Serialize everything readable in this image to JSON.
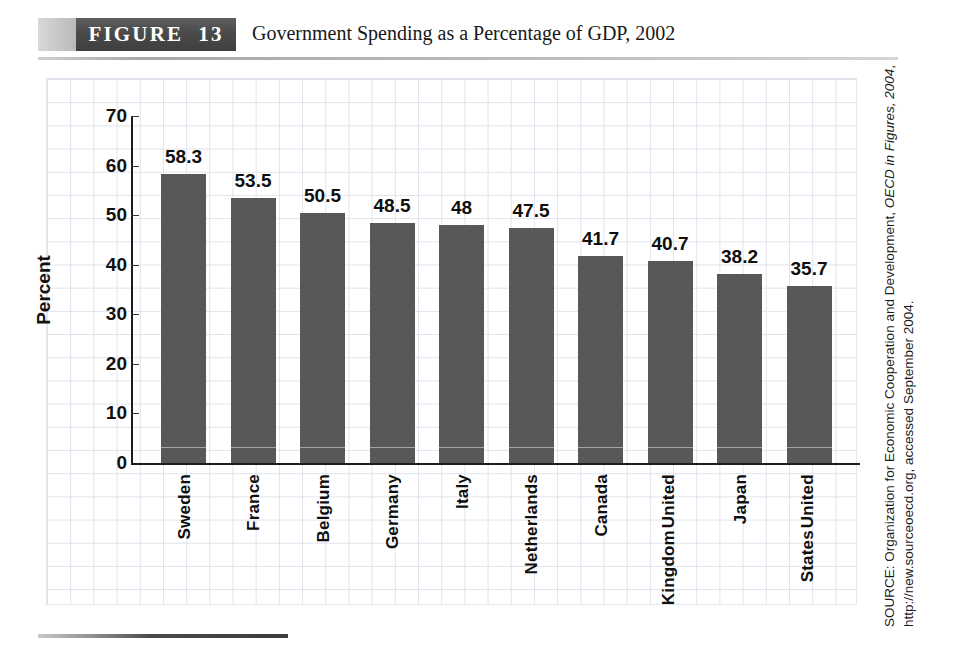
{
  "header": {
    "banner_label": "FIGURE  13",
    "title": "Government Spending as a Percentage of GDP, 2002",
    "banner_dark_color": "#474747",
    "banner_light_color": "#c9c9c9"
  },
  "source": {
    "prefix": "SOURCE: Organization for Economic Cooperation and Development, ",
    "italic": "OECD in Figures, 2004",
    "suffix": ", http://new.sourceoecd.org, accessed September 2004."
  },
  "chart_data": {
    "type": "bar",
    "title": "Government Spending as a Percentage of GDP, 2002",
    "xlabel": "",
    "ylabel": "Percent",
    "ylim": [
      0,
      70
    ],
    "yticks": [
      70,
      60,
      50,
      40,
      30,
      20,
      10,
      0
    ],
    "grid": true,
    "legend": "none",
    "bar_color": "#585858",
    "categories": [
      "Sweden",
      "France",
      "Belgium",
      "Germany",
      "Italy",
      "Netherlands",
      "Canada",
      "United Kingdom",
      "Japan",
      "United States"
    ],
    "category_lines": [
      [
        "Sweden"
      ],
      [
        "France"
      ],
      [
        "Belgium"
      ],
      [
        "Germany"
      ],
      [
        "Italy"
      ],
      [
        "Netherlands"
      ],
      [
        "Canada"
      ],
      [
        "United",
        "Kingdom"
      ],
      [
        "Japan"
      ],
      [
        "United",
        "States"
      ]
    ],
    "values": [
      58.3,
      53.5,
      50.5,
      48.5,
      48,
      47.5,
      41.7,
      40.7,
      38.2,
      35.7
    ],
    "value_labels": [
      "58.3",
      "53.5",
      "50.5",
      "48.5",
      "48",
      "47.5",
      "41.7",
      "40.7",
      "38.2",
      "35.7"
    ]
  }
}
